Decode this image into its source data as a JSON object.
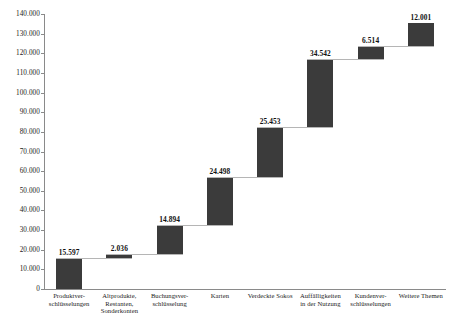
{
  "chart_data": {
    "type": "bar",
    "subtype": "waterfall",
    "title": "",
    "subtitle": "",
    "xlabel": "",
    "ylabel": "",
    "ylim": [
      0,
      140000
    ],
    "ytick_step": 10000,
    "grid": false,
    "legend": null,
    "number_format": "de-DE (dot thousands separator)",
    "bar_color": "#3b3b3b",
    "connector_color": "#b5b5b5",
    "axis_color": "#8a8a8a",
    "ytick_labels": [
      "140.000",
      "130.000",
      "120.000",
      "110.000",
      "100.000",
      "90.000",
      "80.000",
      "70.000",
      "60.000",
      "50.000",
      "40.000",
      "30.000",
      "20.000",
      "10.000",
      "0"
    ],
    "ytick_values": [
      140000,
      130000,
      120000,
      110000,
      100000,
      90000,
      80000,
      70000,
      60000,
      50000,
      40000,
      30000,
      20000,
      10000,
      0
    ],
    "categories": [
      "Produktver-\nschlüsselungen",
      "Altprodukte,\nRestanten,\nSonderkonten",
      "Buchungsver-\nschlüsselung",
      "Karten",
      "Verdeckte Sokos",
      "Auffälligkeiten\nin der Nutzung",
      "Kundenver-\nschlüsselungen",
      "Weitere Themen"
    ],
    "values": [
      15597,
      2036,
      14894,
      24498,
      25453,
      34542,
      6514,
      12001
    ],
    "value_labels": [
      "15.597",
      "2.036",
      "14.894",
      "24.498",
      "25.453",
      "34.542",
      "6.514",
      "12.001"
    ],
    "bar_bases": [
      0,
      15597,
      17633,
      32527,
      57025,
      82478,
      117020,
      123534
    ],
    "bar_tops": [
      15597,
      17633,
      32527,
      57025,
      82478,
      117020,
      123534,
      135535
    ],
    "cumulative_total": 135535
  }
}
